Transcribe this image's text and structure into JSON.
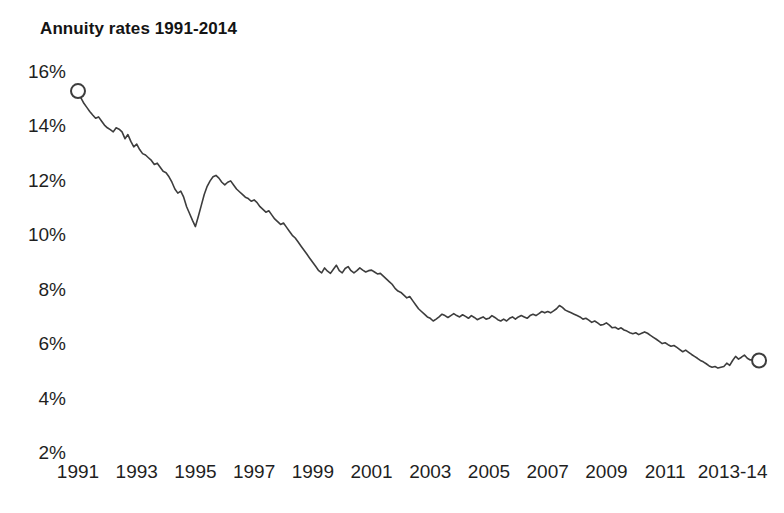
{
  "chart_data": {
    "type": "line",
    "title": "Annuity rates 1991-2014",
    "xlabel": "",
    "ylabel": "",
    "ylim": [
      2,
      16
    ],
    "xlim": [
      1991,
      2014.3
    ],
    "grid": false,
    "legend": null,
    "y_tick_labels": [
      "16%",
      "14%",
      "12%",
      "10%",
      "8%",
      "6%",
      "4%",
      "2%"
    ],
    "y_tick_values": [
      16,
      14,
      12,
      10,
      8,
      6,
      4,
      2
    ],
    "x_tick_labels": [
      "1991",
      "1993",
      "1995",
      "1997",
      "1999",
      "2001",
      "2003",
      "2005",
      "2007",
      "2009",
      "2011",
      "2013-14"
    ],
    "x_tick_values": [
      1991,
      1993,
      1995,
      1997,
      1999,
      2001,
      2003,
      2005,
      2007,
      2009,
      2011,
      2013.3
    ],
    "series": [
      {
        "name": "Annuity rate",
        "units": "percent",
        "start_marker": {
          "x": 1991.0,
          "y": 15.3,
          "shape": "open-circle"
        },
        "end_marker": {
          "x": 2014.2,
          "y": 5.4,
          "shape": "open-circle"
        },
        "x": [
          1991.0,
          1991.1,
          1991.2,
          1991.3,
          1991.4,
          1991.5,
          1991.6,
          1991.7,
          1991.8,
          1991.9,
          1992.0,
          1992.1,
          1992.2,
          1992.3,
          1992.4,
          1992.5,
          1992.6,
          1992.7,
          1992.8,
          1992.9,
          1993.0,
          1993.1,
          1993.2,
          1993.3,
          1993.4,
          1993.5,
          1993.6,
          1993.7,
          1993.8,
          1993.9,
          1994.0,
          1994.1,
          1994.2,
          1994.3,
          1994.4,
          1994.5,
          1994.6,
          1994.7,
          1994.8,
          1994.9,
          1995.0,
          1995.1,
          1995.2,
          1995.3,
          1995.4,
          1995.5,
          1995.6,
          1995.7,
          1995.8,
          1995.9,
          1996.0,
          1996.1,
          1996.2,
          1996.3,
          1996.4,
          1996.5,
          1996.6,
          1996.7,
          1996.8,
          1996.9,
          1997.0,
          1997.1,
          1997.2,
          1997.3,
          1997.4,
          1997.5,
          1997.6,
          1997.7,
          1997.8,
          1997.9,
          1998.0,
          1998.1,
          1998.2,
          1998.3,
          1998.4,
          1998.5,
          1998.6,
          1998.7,
          1998.8,
          1998.9,
          1999.0,
          1999.1,
          1999.2,
          1999.3,
          1999.4,
          1999.5,
          1999.6,
          1999.7,
          1999.8,
          1999.9,
          2000.0,
          2000.1,
          2000.2,
          2000.3,
          2000.4,
          2000.5,
          2000.6,
          2000.7,
          2000.8,
          2000.9,
          2001.0,
          2001.1,
          2001.2,
          2001.3,
          2001.4,
          2001.5,
          2001.6,
          2001.7,
          2001.8,
          2001.9,
          2002.0,
          2002.1,
          2002.2,
          2002.3,
          2002.4,
          2002.5,
          2002.6,
          2002.7,
          2002.8,
          2002.9,
          2003.0,
          2003.1,
          2003.2,
          2003.3,
          2003.4,
          2003.5,
          2003.6,
          2003.7,
          2003.8,
          2003.9,
          2004.0,
          2004.1,
          2004.2,
          2004.3,
          2004.4,
          2004.5,
          2004.6,
          2004.7,
          2004.8,
          2004.9,
          2005.0,
          2005.1,
          2005.2,
          2005.3,
          2005.4,
          2005.5,
          2005.6,
          2005.7,
          2005.8,
          2005.9,
          2006.0,
          2006.1,
          2006.2,
          2006.3,
          2006.4,
          2006.5,
          2006.6,
          2006.7,
          2006.8,
          2006.9,
          2007.0,
          2007.1,
          2007.2,
          2007.3,
          2007.4,
          2007.5,
          2007.6,
          2007.7,
          2007.8,
          2007.9,
          2008.0,
          2008.1,
          2008.2,
          2008.3,
          2008.4,
          2008.5,
          2008.6,
          2008.7,
          2008.8,
          2008.9,
          2009.0,
          2009.1,
          2009.2,
          2009.3,
          2009.4,
          2009.5,
          2009.6,
          2009.7,
          2009.8,
          2009.9,
          2010.0,
          2010.1,
          2010.2,
          2010.3,
          2010.4,
          2010.5,
          2010.6,
          2010.7,
          2010.8,
          2010.9,
          2011.0,
          2011.1,
          2011.2,
          2011.3,
          2011.4,
          2011.5,
          2011.6,
          2011.7,
          2011.8,
          2011.9,
          2012.0,
          2012.1,
          2012.2,
          2012.3,
          2012.4,
          2012.5,
          2012.6,
          2012.7,
          2012.8,
          2012.9,
          2013.0,
          2013.1,
          2013.2,
          2013.3,
          2013.4,
          2013.5,
          2013.6,
          2013.7,
          2013.8,
          2013.9,
          2014.0,
          2014.1,
          2014.2
        ],
        "y": [
          15.3,
          15.05,
          14.85,
          14.7,
          14.55,
          14.42,
          14.3,
          14.35,
          14.2,
          14.05,
          13.95,
          13.88,
          13.8,
          13.95,
          13.9,
          13.8,
          13.55,
          13.7,
          13.45,
          13.25,
          13.35,
          13.15,
          13.0,
          12.95,
          12.85,
          12.75,
          12.6,
          12.65,
          12.5,
          12.35,
          12.3,
          12.15,
          11.95,
          11.7,
          11.55,
          11.62,
          11.4,
          11.05,
          10.8,
          10.55,
          10.32,
          10.7,
          11.1,
          11.5,
          11.8,
          12.0,
          12.15,
          12.2,
          12.1,
          11.95,
          11.85,
          11.95,
          12.0,
          11.85,
          11.7,
          11.6,
          11.5,
          11.4,
          11.35,
          11.25,
          11.3,
          11.2,
          11.05,
          10.95,
          10.85,
          10.9,
          10.75,
          10.6,
          10.5,
          10.4,
          10.45,
          10.3,
          10.15,
          10.0,
          9.9,
          9.75,
          9.6,
          9.45,
          9.3,
          9.15,
          9.0,
          8.85,
          8.7,
          8.62,
          8.8,
          8.68,
          8.6,
          8.75,
          8.9,
          8.7,
          8.62,
          8.78,
          8.85,
          8.7,
          8.62,
          8.7,
          8.8,
          8.72,
          8.65,
          8.7,
          8.72,
          8.65,
          8.58,
          8.6,
          8.5,
          8.4,
          8.3,
          8.2,
          8.05,
          7.95,
          7.9,
          7.8,
          7.7,
          7.75,
          7.6,
          7.45,
          7.3,
          7.2,
          7.1,
          7.0,
          6.95,
          6.85,
          6.92,
          7.0,
          7.1,
          7.05,
          6.98,
          7.05,
          7.12,
          7.05,
          7.0,
          7.08,
          7.02,
          6.95,
          7.05,
          6.98,
          6.9,
          6.95,
          7.0,
          6.92,
          6.95,
          7.05,
          6.98,
          6.9,
          6.85,
          6.92,
          6.85,
          6.95,
          7.0,
          6.92,
          7.0,
          7.05,
          7.0,
          6.95,
          7.05,
          7.1,
          7.05,
          7.12,
          7.2,
          7.15,
          7.2,
          7.15,
          7.22,
          7.3,
          7.42,
          7.35,
          7.25,
          7.2,
          7.15,
          7.1,
          7.05,
          7.0,
          6.92,
          6.95,
          6.88,
          6.8,
          6.85,
          6.78,
          6.7,
          6.72,
          6.78,
          6.7,
          6.6,
          6.62,
          6.55,
          6.6,
          6.52,
          6.48,
          6.42,
          6.38,
          6.42,
          6.35,
          6.4,
          6.45,
          6.4,
          6.32,
          6.25,
          6.18,
          6.1,
          6.02,
          6.05,
          5.98,
          5.92,
          5.95,
          5.88,
          5.8,
          5.72,
          5.78,
          5.7,
          5.62,
          5.55,
          5.48,
          5.4,
          5.35,
          5.28,
          5.2,
          5.15,
          5.18,
          5.12,
          5.15,
          5.18,
          5.3,
          5.22,
          5.4,
          5.55,
          5.45,
          5.52,
          5.6,
          5.48,
          5.42,
          5.45,
          5.4,
          5.4
        ]
      }
    ]
  },
  "plot_geometry": {
    "left": 78,
    "right": 762,
    "top": 72,
    "bottom": 453
  }
}
